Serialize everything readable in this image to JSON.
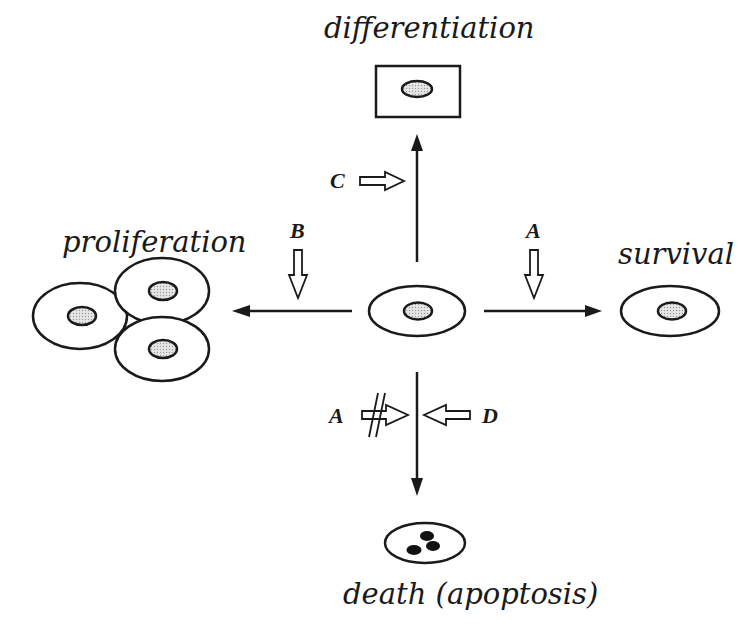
{
  "diagram": {
    "center_cell": {
      "label": "",
      "type": "cell"
    },
    "outcomes": [
      {
        "id": "differentiation",
        "label": "differentiation",
        "direction": "up",
        "shape": "rectangular-cell"
      },
      {
        "id": "proliferation",
        "label": "proliferation",
        "direction": "left",
        "shape": "three-cells"
      },
      {
        "id": "survival",
        "label": "survival",
        "direction": "right",
        "shape": "cell"
      },
      {
        "id": "death",
        "label": "death (apoptosis)",
        "direction": "down",
        "shape": "apoptotic-cell"
      }
    ],
    "modulators": [
      {
        "letter": "C",
        "target": "differentiation",
        "effect": "promotes"
      },
      {
        "letter": "B",
        "target": "proliferation",
        "effect": "promotes"
      },
      {
        "letter": "A",
        "target": "survival",
        "effect": "promotes"
      },
      {
        "letter": "A",
        "target": "death",
        "effect": "inhibits"
      },
      {
        "letter": "D",
        "target": "death",
        "effect": "promotes"
      }
    ],
    "colors": {
      "stroke": "#1a1a1a",
      "nucleus_fill": "#cfcfcf",
      "fragment_fill": "#111111",
      "background": "#ffffff"
    }
  }
}
